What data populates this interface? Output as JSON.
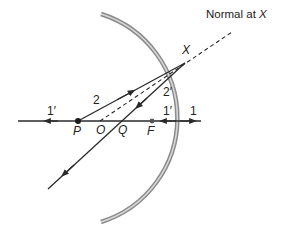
{
  "diagram": {
    "colors": {
      "background": "#ffffff",
      "ray": "#2a2a2a",
      "mirror_outer": "#8a8a8a",
      "mirror_inner": "#d6d6d6",
      "text": "#222222"
    },
    "labels": {
      "normal": "Normal at",
      "normal_point": "X",
      "point_x": "X",
      "point_p": "P",
      "point_o": "O",
      "point_q": "Q",
      "point_f": "F",
      "ray_1": "1",
      "ray_1_reflected_right": "1′",
      "ray_1_reflected_left": "1′",
      "ray_2": "2",
      "ray_2_reflected": "2′"
    },
    "points": {
      "P": [
        78,
        121
      ],
      "O": [
        100,
        121
      ],
      "Q": [
        122,
        121
      ],
      "F": [
        152,
        121
      ],
      "X": [
        185,
        63
      ]
    }
  }
}
